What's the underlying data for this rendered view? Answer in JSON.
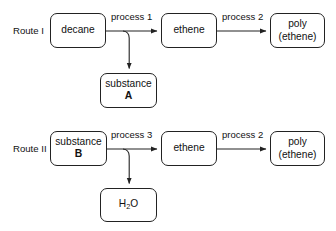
{
  "diagram": {
    "type": "process-flow",
    "background_color": "#ffffff",
    "line_color": "#222222",
    "text_color": "#111111"
  },
  "routes": [
    {
      "id": "route-1",
      "label": "Route I",
      "start_node": "decane",
      "steps": [
        "process 1",
        "process 2"
      ],
      "byproduct": "substance A"
    },
    {
      "id": "route-2",
      "label": "Route II",
      "start_node": "substance B",
      "steps": [
        "process 3",
        "process 2"
      ],
      "byproduct": "H2O"
    }
  ],
  "nodes": {
    "decane": {
      "line1": "decane",
      "line2": ""
    },
    "ethene_top": {
      "line1": "ethene",
      "line2": ""
    },
    "poly_top": {
      "line1": "poly",
      "line2": "(ethene)"
    },
    "substance_a": {
      "line1": "substance",
      "line2": "A"
    },
    "substance_b": {
      "line1": "substance",
      "line2": "B"
    },
    "ethene_bottom": {
      "line1": "ethene",
      "line2": ""
    },
    "poly_bottom": {
      "line1": "poly",
      "line2": "(ethene)"
    },
    "water": {
      "line1": "H",
      "sub": "2",
      "line1b": "O"
    }
  },
  "edges": {
    "process_1": "process 1",
    "process_2_top": "process 2",
    "process_3": "process 3",
    "process_2_bottom": "process 2"
  }
}
